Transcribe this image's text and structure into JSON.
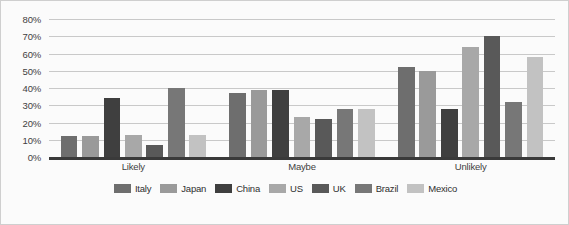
{
  "chart_data": {
    "type": "bar",
    "title": "",
    "subtitle": "",
    "xlabel": "",
    "ylabel": "",
    "categories": [
      "Likely",
      "Maybe",
      "Unlikely"
    ],
    "ylim": [
      0,
      80
    ],
    "ytick_values": [
      0,
      10,
      20,
      30,
      40,
      50,
      60,
      70,
      80
    ],
    "ytick_labels": [
      "0%",
      "10%",
      "20%",
      "30%",
      "40%",
      "50%",
      "60%",
      "70%",
      "80%"
    ],
    "grid": true,
    "legend_position": "bottom",
    "series": [
      {
        "name": "Italy",
        "color": "#6e6e6e",
        "values": [
          12,
          37,
          52
        ]
      },
      {
        "name": "Japan",
        "color": "#9a9a9a",
        "values": [
          12,
          39,
          50
        ]
      },
      {
        "name": "China",
        "color": "#3f3f3f",
        "values": [
          34,
          39,
          28
        ]
      },
      {
        "name": "US",
        "color": "#a8a8a8",
        "values": [
          13,
          23,
          64
        ]
      },
      {
        "name": "UK",
        "color": "#595959",
        "values": [
          7,
          22,
          70
        ]
      },
      {
        "name": "Brazil",
        "color": "#777777",
        "values": [
          40,
          28,
          32
        ]
      },
      {
        "name": "Mexico",
        "color": "#c2c2c2",
        "values": [
          13,
          28,
          58
        ]
      }
    ]
  },
  "legend": {
    "items": [
      {
        "label": "Italy"
      },
      {
        "label": "Japan"
      },
      {
        "label": "China"
      },
      {
        "label": "US"
      },
      {
        "label": "UK"
      },
      {
        "label": "Brazil"
      },
      {
        "label": "Mexico"
      }
    ]
  }
}
